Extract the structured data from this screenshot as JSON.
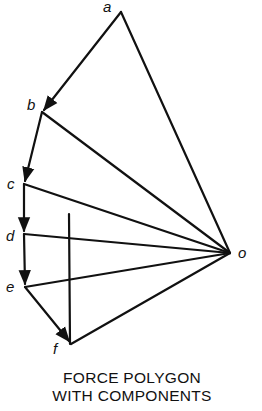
{
  "diagram": {
    "title_line1": "FORCE POLYGON",
    "title_line2": "WITH COMPONENTS",
    "points": {
      "a": {
        "label": "a"
      },
      "b": {
        "label": "b"
      },
      "c": {
        "label": "c"
      },
      "d": {
        "label": "d"
      },
      "e": {
        "label": "e"
      },
      "f": {
        "label": "f"
      },
      "o": {
        "label": "o"
      }
    },
    "load_vectors": [
      "a-b",
      "b-c",
      "c-d",
      "d-e",
      "e-f"
    ],
    "rays": [
      "o-a",
      "o-b",
      "o-c",
      "o-d",
      "o-e",
      "o-f"
    ],
    "component_line": "vertical line through f",
    "line_color": "#111111"
  }
}
